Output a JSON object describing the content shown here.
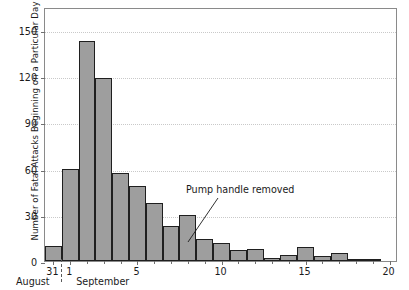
{
  "chart_data": {
    "type": "bar",
    "title": "",
    "subtitle": "",
    "xlabel": "",
    "ylabel": "Number of Fatal Attacks Beginning on a Particular Day",
    "ylim": [
      0,
      165
    ],
    "yticks": [
      0,
      30,
      60,
      90,
      120,
      150
    ],
    "ytick_labels": [
      "0",
      "30",
      "60",
      "90",
      "120",
      "150"
    ],
    "grid": "horizontal-dotted",
    "legend": "none",
    "categories": [
      "Aug 31",
      "Sep 1",
      "Sep 2",
      "Sep 3",
      "Sep 4",
      "Sep 5",
      "Sep 6",
      "Sep 7",
      "Sep 8",
      "Sep 9",
      "Sep 10",
      "Sep 11",
      "Sep 12",
      "Sep 13",
      "Sep 14",
      "Sep 15",
      "Sep 16",
      "Sep 17",
      "Sep 18",
      "Sep 19",
      "Sep 20"
    ],
    "values": [
      10,
      60,
      143,
      119,
      57,
      49,
      38,
      23,
      30,
      14,
      12,
      7,
      8,
      2,
      4,
      9,
      3,
      5,
      1,
      0.5,
      0
    ],
    "xtick_labels": [
      {
        "label": "31",
        "category": "Aug 31"
      },
      {
        "label": "1",
        "category": "Sep 1"
      },
      {
        "label": "5",
        "category": "Sep 5"
      },
      {
        "label": "10",
        "category": "Sep 10"
      },
      {
        "label": "15",
        "category": "Sep 15"
      },
      {
        "label": "20",
        "category": "Sep 20"
      }
    ],
    "month_labels": [
      "August",
      "September"
    ],
    "annotations": [
      {
        "text": "Pump handle removed",
        "points_to_category": "Sep 8"
      }
    ],
    "colors": {
      "bar_fill": "#9e9e9e",
      "bar_edge": "#1f1f1f",
      "axis": "#6f6f6f",
      "grid": "#c9c9c9",
      "text": "#1a1a1a",
      "background": "#ffffff"
    }
  }
}
